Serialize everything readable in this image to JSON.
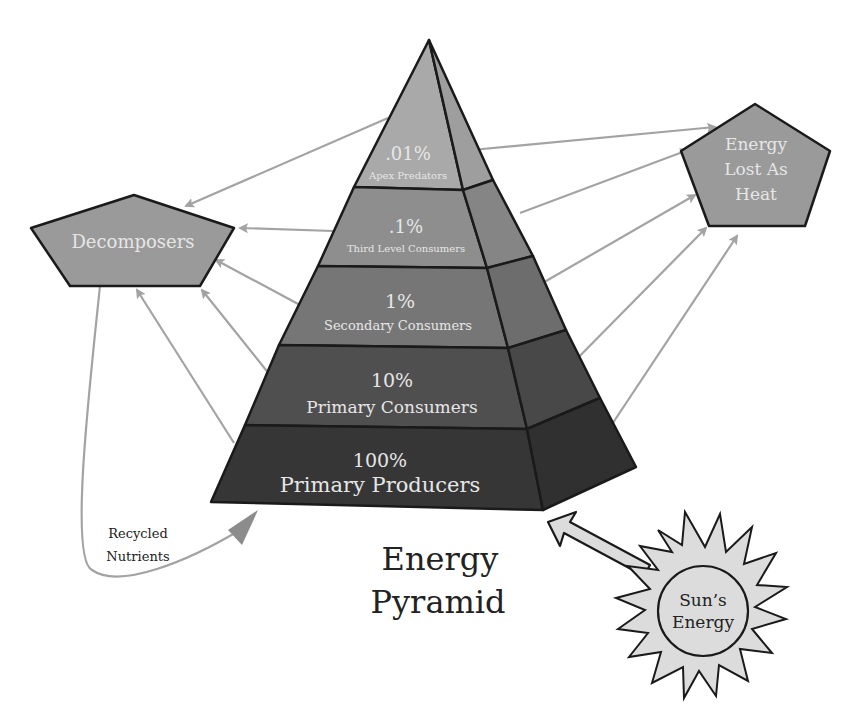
{
  "title": {
    "line1": "Energy",
    "line2": "Pyramid"
  },
  "pyramid": {
    "levels": [
      {
        "percent": ".01%",
        "name": "Apex Predators",
        "color": "#a9a9a9",
        "side_color": "#9e9e9e"
      },
      {
        "percent": ".1%",
        "name": "Third Level Consumers",
        "color": "#8e8e8e",
        "side_color": "#858585"
      },
      {
        "percent": "1%",
        "name": "Secondary Consumers",
        "color": "#767676",
        "side_color": "#6d6d6d"
      },
      {
        "percent": "10%",
        "name": "Primary Consumers",
        "color": "#4f4f4f",
        "side_color": "#484848"
      },
      {
        "percent": "100%",
        "name": "Primary Producers",
        "color": "#363636",
        "side_color": "#303030"
      }
    ]
  },
  "decomposers": {
    "label": "Decomposers",
    "color": "#9a9a9a"
  },
  "heat": {
    "line1": "Energy",
    "line2": "Lost As",
    "line3": "Heat",
    "color": "#9a9a9a"
  },
  "sun": {
    "line1": "Sun’s",
    "line2": "Energy",
    "color": "#dcdcdc"
  },
  "recycled": {
    "line1": "Recycled",
    "line2": "Nutrients"
  },
  "colors": {
    "arrow": "#a3a3a3",
    "outline": "#1a1a1a",
    "label_light": "#e6e6e6",
    "label_dark": "#222222"
  }
}
